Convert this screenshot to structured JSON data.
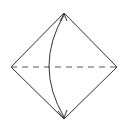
{
  "diagram": {
    "type": "origami-fold",
    "colors": {
      "line": "#333333",
      "background": "#ffffff",
      "dashed": "#555555"
    },
    "square": {
      "top": [
        64,
        13
      ],
      "right": [
        117,
        67
      ],
      "bottom": [
        64,
        119
      ],
      "left": [
        11,
        67
      ]
    },
    "fold_line": {
      "style": "dashed",
      "from": [
        11,
        67
      ],
      "to": [
        117,
        67
      ]
    },
    "arrow": {
      "from": [
        64,
        119
      ],
      "to": [
        64,
        13
      ],
      "bulge_x": 49,
      "heads": [
        "top",
        "bottom"
      ]
    }
  }
}
